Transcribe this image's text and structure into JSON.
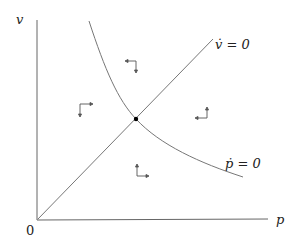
{
  "diagram": {
    "type": "phase-diagram",
    "axes": {
      "x_label": "p",
      "y_label": "v",
      "origin_label": "0"
    },
    "curves": [
      {
        "name": "v-dot-nullcline",
        "label_text": "v̇ = 0",
        "shape": "line-through-origin"
      },
      {
        "name": "p-dot-nullcline",
        "label_text": "ṗ = 0",
        "shape": "downward-sloping-convex"
      }
    ],
    "equilibrium": {
      "label": "",
      "marker": "dot"
    },
    "direction_arrows": [
      {
        "region": "left",
        "directions": [
          "right",
          "down"
        ]
      },
      {
        "region": "top",
        "directions": [
          "left",
          "down"
        ]
      },
      {
        "region": "right",
        "directions": [
          "left",
          "up"
        ]
      },
      {
        "region": "bottom",
        "directions": [
          "right",
          "up"
        ]
      }
    ],
    "colors": {
      "lines": "#555555",
      "dot": "#000000",
      "text": "#222222"
    }
  }
}
